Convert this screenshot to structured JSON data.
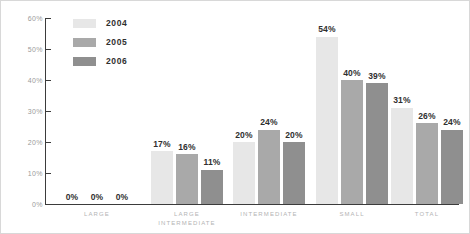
{
  "chart_data": {
    "type": "bar",
    "title": "",
    "xlabel": "",
    "ylabel": "",
    "ylim": [
      0,
      60
    ],
    "grid": false,
    "legend_position": "top-left",
    "y_ticks": [
      "0%",
      "10%",
      "20%",
      "30%",
      "40%",
      "50%",
      "60%"
    ],
    "y_tick_values": [
      0,
      10,
      20,
      30,
      40,
      50,
      60
    ],
    "categories": [
      "LARGE",
      "LARGE\nINTERMEDIATE",
      "INTERMEDIATE",
      "SMALL",
      "TOTAL"
    ],
    "series": [
      {
        "name": "2004",
        "color": "#e7e7e7",
        "values": [
          0,
          17,
          20,
          54,
          31
        ],
        "labels": [
          "0%",
          "17%",
          "20%",
          "54%",
          "31%"
        ]
      },
      {
        "name": "2005",
        "color": "#a9a9a9",
        "values": [
          0,
          16,
          24,
          40,
          26
        ],
        "labels": [
          "0%",
          "16%",
          "24%",
          "40%",
          "26%"
        ]
      },
      {
        "name": "2006",
        "color": "#8f8f8f",
        "values": [
          0,
          11,
          20,
          39,
          24
        ],
        "labels": [
          "0%",
          "11%",
          "20%",
          "39%",
          "24%"
        ]
      }
    ]
  },
  "style": {
    "axis_color": "#3b3b3b",
    "tick_label_color": "#9a9a9a",
    "category_label_color": "#b4b4b4",
    "value_label_color": "#2f2f2f",
    "background": "#ffffff",
    "border": "#d8d8d8"
  }
}
